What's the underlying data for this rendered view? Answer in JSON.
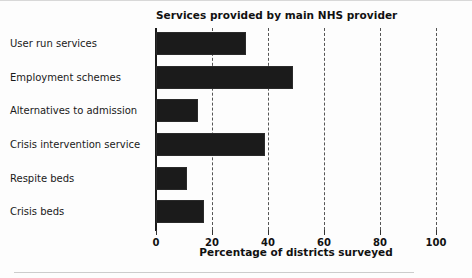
{
  "chart_data": {
    "type": "bar",
    "orientation": "horizontal",
    "title": "Services provided by main NHS provider",
    "xlabel": "Percentage of districts surveyed",
    "ylabel": "",
    "categories": [
      "User run services",
      "Employment schemes",
      "Alternatives to admission",
      "Crisis intervention service",
      "Respite beds",
      "Crisis beds"
    ],
    "values": [
      32,
      49,
      15,
      39,
      11,
      17
    ],
    "xlim": [
      0,
      100
    ],
    "xticks": [
      0,
      20,
      40,
      60,
      80,
      100
    ],
    "xtick_labels": [
      "0",
      "20",
      "40",
      "60",
      "80",
      "100"
    ],
    "grid": "vertical-dashed",
    "legend": "none",
    "bar_color": "#1b1b1b",
    "background_color": "#fdfdfd",
    "text_color": "#1a1a1a"
  }
}
